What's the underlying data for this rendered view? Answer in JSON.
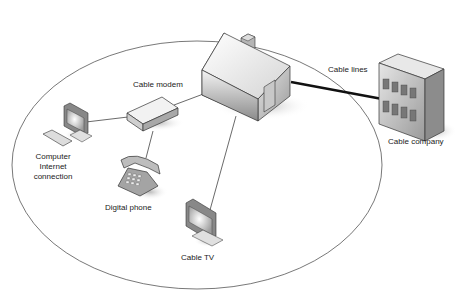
{
  "diagram": {
    "labels": {
      "cable_modem": "Cable modem",
      "cable_lines": "Cable lines",
      "cable_company": "Cable company",
      "computer_line1": "Computer",
      "computer_line2": "Internet",
      "computer_line3": "connection",
      "digital_phone": "Digital phone",
      "cable_tv": "Cable TV"
    },
    "nodes": [
      {
        "id": "house",
        "icon": "house-icon"
      },
      {
        "id": "cable-company",
        "icon": "office-building-icon"
      },
      {
        "id": "cable-modem",
        "icon": "modem-icon"
      },
      {
        "id": "computer",
        "icon": "computer-monitor-icon"
      },
      {
        "id": "digital-phone",
        "icon": "telephone-icon"
      },
      {
        "id": "cable-tv",
        "icon": "tv-monitor-icon"
      }
    ],
    "edges": [
      {
        "from": "house",
        "to": "cable-company",
        "label": "Cable lines",
        "style": "thick"
      },
      {
        "from": "house",
        "to": "cable-modem"
      },
      {
        "from": "house",
        "to": "cable-tv"
      },
      {
        "from": "cable-modem",
        "to": "computer"
      },
      {
        "from": "cable-modem",
        "to": "digital-phone"
      }
    ],
    "colors": {
      "stroke": "#333333",
      "boundary": "#555555",
      "background": "#ffffff"
    }
  }
}
